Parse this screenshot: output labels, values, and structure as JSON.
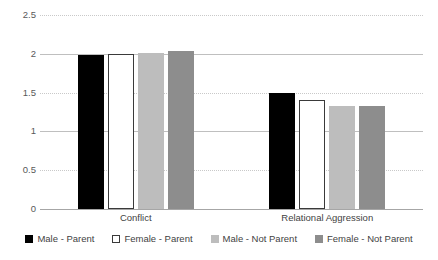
{
  "chart_data": {
    "type": "bar",
    "title": "",
    "subtitle": "",
    "xlabel": "",
    "ylabel": "",
    "categories": [
      "Conflict",
      "Relational Aggression"
    ],
    "series": [
      {
        "name": "Male - Parent",
        "color": "#000000",
        "style": "solid",
        "values": [
          1.98,
          1.5
        ]
      },
      {
        "name": "Female - Parent",
        "color": "#ffffff",
        "style": "outline",
        "values": [
          2.0,
          1.4
        ]
      },
      {
        "name": "Male - Not Parent",
        "color": "#bdbdbd",
        "style": "solid",
        "values": [
          2.01,
          1.33
        ]
      },
      {
        "name": "Female - Not Parent",
        "color": "#8d8d8d",
        "style": "solid",
        "values": [
          2.03,
          1.33
        ]
      }
    ],
    "ylim": [
      0,
      2.5
    ],
    "yticks": [
      "0",
      "0.5",
      "1",
      "1.5",
      "2",
      "2.5"
    ],
    "ytick_values": [
      0,
      0.5,
      1,
      1.5,
      2,
      2.5
    ],
    "grid": true,
    "legend_position": "bottom"
  },
  "axis": {
    "y_tick_labels": [
      "0",
      "0.5",
      "1",
      "1.5",
      "2",
      "2.5"
    ],
    "x_tick_labels": [
      "Conflict",
      "Relational Aggression"
    ]
  },
  "legend": {
    "items": [
      {
        "label": "Male - Parent"
      },
      {
        "label": "Female - Parent"
      },
      {
        "label": "Male - Not Parent"
      },
      {
        "label": "Female - Not Parent"
      }
    ]
  }
}
